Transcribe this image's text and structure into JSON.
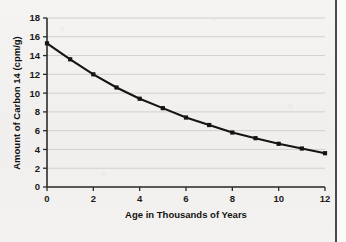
{
  "chart_data": {
    "type": "line",
    "title": "",
    "xlabel": "Age in Thousands of Years",
    "ylabel": "Amount of Carbon 14 (cpm/g)",
    "xlim": [
      0,
      12
    ],
    "ylim": [
      0,
      18
    ],
    "xticks": [
      0,
      2,
      4,
      6,
      8,
      10,
      12
    ],
    "yticks": [
      0,
      2,
      4,
      6,
      8,
      10,
      12,
      14,
      16,
      18
    ],
    "xtick_labels": [
      "0",
      "2",
      "4",
      "6",
      "8",
      "10",
      "12"
    ],
    "ytick_labels": [
      "0",
      "2",
      "4",
      "6",
      "8",
      "10",
      "12",
      "14",
      "16",
      "18"
    ],
    "grid": "horizontal",
    "legend": "none",
    "x": [
      0,
      1,
      2,
      3,
      4,
      5,
      6,
      7,
      8,
      9,
      10,
      11,
      12
    ],
    "values": [
      15.3,
      13.6,
      12.0,
      10.6,
      9.4,
      8.4,
      7.4,
      6.6,
      5.8,
      5.2,
      4.6,
      4.1,
      3.6
    ],
    "series": [
      {
        "name": "Carbon 14 decay",
        "values": [
          15.3,
          13.6,
          12.0,
          10.6,
          9.4,
          8.4,
          7.4,
          6.6,
          5.8,
          5.2,
          4.6,
          4.1,
          3.6
        ]
      }
    ],
    "marker": "square",
    "line_color": "#141414",
    "marker_color": "#141414",
    "grid_color": "#c9c6c3",
    "axis_color": "#2b2b2b",
    "background_color": "#f4f2f0"
  }
}
